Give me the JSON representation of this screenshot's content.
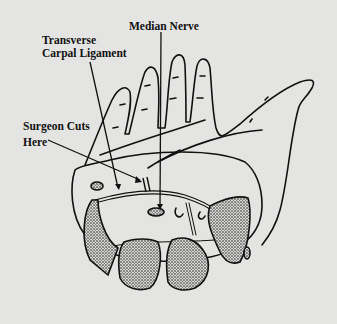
{
  "diagram": {
    "labels": {
      "median_nerve": "Median Nerve",
      "ligament_line1": "Transverse",
      "ligament_line2": "Carpal Ligament",
      "cut_line1": "Surgeon Cuts",
      "cut_line2": "Here"
    },
    "colors": {
      "background": "#e4e4e2",
      "stroke": "#111111",
      "bone_fill": "#9a9a98"
    }
  }
}
